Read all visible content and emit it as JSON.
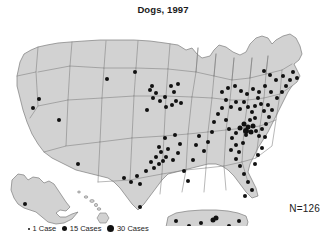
{
  "figure": {
    "title": "Dogs, 1997",
    "annotation": "N=126",
    "background_color": "#ffffff",
    "land_fill_color": "#d2d2d2",
    "border_color": "#7d7d7d",
    "dot_color": "#111111"
  },
  "legend": {
    "items": [
      {
        "label": "1 Case",
        "size_px": 2.0,
        "cases": 1
      },
      {
        "label": "15 Cases",
        "size_px": 5.0,
        "cases": 15
      },
      {
        "label": "30 Cases",
        "size_px": 7.0,
        "cases": 30
      }
    ]
  },
  "chart_data": {
    "type": "scatter",
    "title": "Dogs, 1997",
    "subtitle": "",
    "xlabel": "",
    "ylabel": "",
    "grid": false,
    "legend_position": "bottom-left",
    "annotations": [
      "N=126"
    ],
    "total_cases": 126,
    "projection_note": "United States choropleth base with Alaska, Hawaii and Puerto Rico insets",
    "map_units": [
      "Contiguous United States",
      "Alaska inset",
      "Hawaii inset",
      "Puerto Rico inset"
    ],
    "series": [
      {
        "name": "Reported dog rabies cases",
        "marker": "filled-circle",
        "color": "#111111",
        "points": [
          {
            "x": 39,
            "y": 85,
            "r": 2.0
          },
          {
            "x": 33,
            "y": 94,
            "r": 2.0
          },
          {
            "x": 59,
            "y": 106,
            "r": 2.0
          },
          {
            "x": 107,
            "y": 65,
            "r": 2.0
          },
          {
            "x": 135,
            "y": 58,
            "r": 2.0
          },
          {
            "x": 150,
            "y": 76,
            "r": 2.0
          },
          {
            "x": 152,
            "y": 72,
            "r": 2.0
          },
          {
            "x": 156,
            "y": 79,
            "r": 2.0
          },
          {
            "x": 153,
            "y": 84,
            "r": 2.0
          },
          {
            "x": 160,
            "y": 87,
            "r": 2.0
          },
          {
            "x": 165,
            "y": 83,
            "r": 2.0
          },
          {
            "x": 171,
            "y": 72,
            "r": 2.0
          },
          {
            "x": 174,
            "y": 78,
            "r": 2.0
          },
          {
            "x": 178,
            "y": 70,
            "r": 2.0
          },
          {
            "x": 176,
            "y": 87,
            "r": 2.0
          },
          {
            "x": 181,
            "y": 89,
            "r": 2.0
          },
          {
            "x": 172,
            "y": 91,
            "r": 2.0
          },
          {
            "x": 166,
            "y": 93,
            "r": 2.0
          },
          {
            "x": 147,
            "y": 96,
            "r": 2.0
          },
          {
            "x": 78,
            "y": 150,
            "r": 2.0
          },
          {
            "x": 124,
            "y": 164,
            "r": 2.0
          },
          {
            "x": 131,
            "y": 168,
            "r": 2.0
          },
          {
            "x": 137,
            "y": 162,
            "r": 2.0
          },
          {
            "x": 140,
            "y": 170,
            "r": 2.0
          },
          {
            "x": 146,
            "y": 157,
            "r": 2.0
          },
          {
            "x": 151,
            "y": 148,
            "r": 2.0
          },
          {
            "x": 154,
            "y": 154,
            "r": 2.0
          },
          {
            "x": 156,
            "y": 143,
            "r": 2.0
          },
          {
            "x": 159,
            "y": 150,
            "r": 2.0
          },
          {
            "x": 161,
            "y": 138,
            "r": 2.0
          },
          {
            "x": 163,
            "y": 147,
            "r": 2.0
          },
          {
            "x": 166,
            "y": 143,
            "r": 2.0
          },
          {
            "x": 159,
            "y": 133,
            "r": 2.0
          },
          {
            "x": 168,
            "y": 135,
            "r": 2.0
          },
          {
            "x": 173,
            "y": 146,
            "r": 2.0
          },
          {
            "x": 178,
            "y": 139,
            "r": 2.0
          },
          {
            "x": 180,
            "y": 130,
            "r": 2.0
          },
          {
            "x": 165,
            "y": 124,
            "r": 2.0
          },
          {
            "x": 175,
            "y": 121,
            "r": 2.0
          },
          {
            "x": 140,
            "y": 193,
            "r": 2.0
          },
          {
            "x": 184,
            "y": 157,
            "r": 2.0
          },
          {
            "x": 188,
            "y": 167,
            "r": 2.0
          },
          {
            "x": 193,
            "y": 146,
            "r": 2.0
          },
          {
            "x": 196,
            "y": 131,
            "r": 2.0
          },
          {
            "x": 199,
            "y": 122,
            "r": 2.0
          },
          {
            "x": 204,
            "y": 137,
            "r": 2.0
          },
          {
            "x": 208,
            "y": 128,
            "r": 2.0
          },
          {
            "x": 212,
            "y": 118,
            "r": 2.0
          },
          {
            "x": 214,
            "y": 108,
            "r": 2.0
          },
          {
            "x": 218,
            "y": 100,
            "r": 2.0
          },
          {
            "x": 222,
            "y": 94,
            "r": 2.0
          },
          {
            "x": 226,
            "y": 106,
            "r": 2.0
          },
          {
            "x": 229,
            "y": 115,
            "r": 2.0
          },
          {
            "x": 232,
            "y": 124,
            "r": 2.0
          },
          {
            "x": 236,
            "y": 131,
            "r": 2.0
          },
          {
            "x": 239,
            "y": 138,
            "r": 2.0
          },
          {
            "x": 243,
            "y": 129,
            "r": 2.0
          },
          {
            "x": 246,
            "y": 121,
            "r": 2.0
          },
          {
            "x": 240,
            "y": 114,
            "r": 2.5
          },
          {
            "x": 244,
            "y": 110,
            "r": 2.5
          },
          {
            "x": 248,
            "y": 113,
            "r": 2.5
          },
          {
            "x": 251,
            "y": 118,
            "r": 2.5
          },
          {
            "x": 246,
            "y": 117,
            "r": 3.0
          },
          {
            "x": 253,
            "y": 112,
            "r": 2.5
          },
          {
            "x": 256,
            "y": 117,
            "r": 2.0
          },
          {
            "x": 259,
            "y": 122,
            "r": 2.0
          },
          {
            "x": 262,
            "y": 115,
            "r": 2.0
          },
          {
            "x": 265,
            "y": 123,
            "r": 2.0
          },
          {
            "x": 250,
            "y": 106,
            "r": 2.0
          },
          {
            "x": 255,
            "y": 104,
            "r": 2.0
          },
          {
            "x": 236,
            "y": 119,
            "r": 2.0
          },
          {
            "x": 231,
            "y": 136,
            "r": 2.0
          },
          {
            "x": 236,
            "y": 145,
            "r": 2.0
          },
          {
            "x": 240,
            "y": 152,
            "r": 2.0
          },
          {
            "x": 244,
            "y": 160,
            "r": 2.0
          },
          {
            "x": 248,
            "y": 168,
            "r": 2.0
          },
          {
            "x": 252,
            "y": 176,
            "r": 2.0
          },
          {
            "x": 245,
            "y": 182,
            "r": 2.0
          },
          {
            "x": 255,
            "y": 150,
            "r": 2.0
          },
          {
            "x": 258,
            "y": 141,
            "r": 2.0
          },
          {
            "x": 262,
            "y": 134,
            "r": 2.0
          },
          {
            "x": 266,
            "y": 110,
            "r": 2.0
          },
          {
            "x": 269,
            "y": 103,
            "r": 2.0
          },
          {
            "x": 272,
            "y": 96,
            "r": 2.0
          },
          {
            "x": 268,
            "y": 91,
            "r": 2.0
          },
          {
            "x": 264,
            "y": 97,
            "r": 2.0
          },
          {
            "x": 261,
            "y": 90,
            "r": 2.0
          },
          {
            "x": 258,
            "y": 84,
            "r": 2.0
          },
          {
            "x": 255,
            "y": 92,
            "r": 2.0
          },
          {
            "x": 252,
            "y": 98,
            "r": 2.0
          },
          {
            "x": 248,
            "y": 93,
            "r": 2.0
          },
          {
            "x": 244,
            "y": 88,
            "r": 2.0
          },
          {
            "x": 240,
            "y": 95,
            "r": 2.0
          },
          {
            "x": 236,
            "y": 88,
            "r": 2.0
          },
          {
            "x": 231,
            "y": 93,
            "r": 2.0
          },
          {
            "x": 226,
            "y": 86,
            "r": 2.0
          },
          {
            "x": 222,
            "y": 78,
            "r": 2.0
          },
          {
            "x": 228,
            "y": 74,
            "r": 2.0
          },
          {
            "x": 235,
            "y": 72,
            "r": 2.0
          },
          {
            "x": 241,
            "y": 77,
            "r": 2.0
          },
          {
            "x": 247,
            "y": 80,
            "r": 2.0
          },
          {
            "x": 253,
            "y": 75,
            "r": 2.0
          },
          {
            "x": 259,
            "y": 78,
            "r": 2.0
          },
          {
            "x": 265,
            "y": 72,
            "r": 2.0
          },
          {
            "x": 271,
            "y": 78,
            "r": 2.0
          },
          {
            "x": 277,
            "y": 84,
            "r": 2.0
          },
          {
            "x": 282,
            "y": 78,
            "r": 2.0
          },
          {
            "x": 286,
            "y": 72,
            "r": 2.0
          },
          {
            "x": 290,
            "y": 66,
            "r": 2.0
          },
          {
            "x": 283,
            "y": 62,
            "r": 2.0
          },
          {
            "x": 276,
            "y": 66,
            "r": 2.0
          },
          {
            "x": 270,
            "y": 61,
            "r": 2.0
          },
          {
            "x": 264,
            "y": 57,
            "r": 2.0
          },
          {
            "x": 293,
            "y": 58,
            "r": 2.0
          },
          {
            "x": 297,
            "y": 64,
            "r": 2.0
          },
          {
            "x": 25,
            "y": 190,
            "r": 2.0
          },
          {
            "x": 176,
            "y": 207,
            "r": 2.0
          },
          {
            "x": 182,
            "y": 216,
            "r": 2.0
          },
          {
            "x": 189,
            "y": 212,
            "r": 2.0
          },
          {
            "x": 194,
            "y": 222,
            "r": 2.0
          },
          {
            "x": 201,
            "y": 209,
            "r": 2.0
          },
          {
            "x": 208,
            "y": 219,
            "r": 2.0
          },
          {
            "x": 213,
            "y": 206,
            "r": 2.5
          },
          {
            "x": 216,
            "y": 204,
            "r": 2.5
          },
          {
            "x": 219,
            "y": 214,
            "r": 2.0
          },
          {
            "x": 224,
            "y": 221,
            "r": 2.0
          },
          {
            "x": 229,
            "y": 212,
            "r": 2.0
          },
          {
            "x": 234,
            "y": 219,
            "r": 2.0
          },
          {
            "x": 239,
            "y": 207,
            "r": 2.0
          }
        ]
      }
    ]
  }
}
